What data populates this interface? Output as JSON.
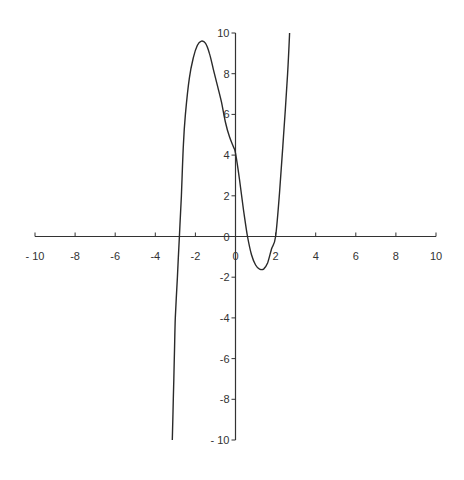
{
  "chart_data": {
    "type": "line",
    "title": "",
    "xlabel": "",
    "ylabel": "",
    "xlim": [
      -10,
      10
    ],
    "ylim": [
      -10,
      10
    ],
    "grid": false,
    "legend": null,
    "x_ticks": [
      -10,
      -8,
      -6,
      -4,
      -2,
      0,
      2,
      4,
      6,
      8,
      10
    ],
    "y_ticks": [
      -10,
      -8,
      -6,
      -4,
      -2,
      0,
      2,
      4,
      6,
      8,
      10
    ],
    "x_tick_labels": [
      "- 10",
      "-8",
      "-6",
      "-4",
      "-2",
      "0",
      "2",
      "4",
      "6",
      "8",
      "10"
    ],
    "y_tick_labels": [
      "- 10",
      "-8",
      "-6",
      "-4",
      "-2",
      "0",
      "2",
      "4",
      "6",
      "8",
      "10"
    ],
    "series": [
      {
        "name": "f(x)",
        "x": [
          -3.15,
          -3.1,
          -3.05,
          -3.0,
          -2.9,
          -2.8,
          -2.7,
          -2.6,
          -2.5,
          -2.3,
          -2.1,
          -1.9,
          -1.7,
          -1.5,
          -1.3,
          -1.1,
          -0.9,
          -0.7,
          -0.5,
          -0.3,
          -0.1,
          0.0,
          0.2,
          0.4,
          0.6,
          0.8,
          1.0,
          1.2,
          1.4,
          1.6,
          1.8,
          2.0,
          2.2,
          2.4,
          2.6,
          2.7
        ],
        "y": [
          -10.0,
          -8.0,
          -6.0,
          -4.0,
          -2.0,
          0.0,
          2.0,
          4.5,
          6.0,
          7.8,
          8.8,
          9.4,
          9.6,
          9.5,
          9.0,
          8.2,
          7.4,
          6.6,
          5.6,
          4.9,
          4.4,
          4.1,
          2.8,
          1.3,
          0.0,
          -0.9,
          -1.4,
          -1.6,
          -1.6,
          -1.3,
          -0.6,
          0.0,
          2.2,
          5.0,
          8.0,
          10.0
        ]
      }
    ]
  },
  "plot": {
    "origin_px": [
      236,
      238
    ],
    "x_left_px": 35,
    "x_right_px": 436,
    "y_top_px": 33,
    "y_bottom_px": 440,
    "stroke_color": "#2a2a2a",
    "axis_color": "#333333"
  }
}
